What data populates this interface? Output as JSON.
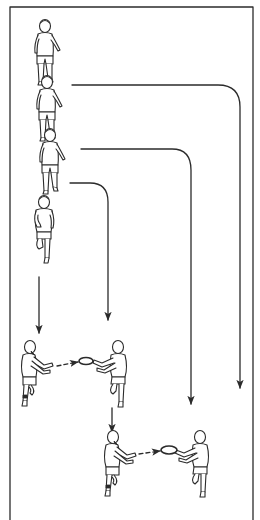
{
  "diagram": {
    "type": "sports-drill-illustration",
    "colors": {
      "line": "#2b2b2b",
      "background": "#ffffff"
    },
    "field": {
      "left": 10,
      "top": 7,
      "right": 253
    },
    "queue_players": 4,
    "runs": [
      {
        "id": "run-1",
        "start": [
          72,
          85
        ],
        "corner_x": 240,
        "end_y": 388
      },
      {
        "id": "run-2",
        "start": [
          81,
          149
        ],
        "corner_x": 191,
        "end_y": 404
      },
      {
        "id": "run-3",
        "start": [
          70,
          183
        ],
        "corner_x": 108,
        "end_y": 320
      }
    ],
    "straight_arrows": [
      {
        "id": "lead-arrow",
        "x": 39,
        "from_y": 277,
        "to_y": 333
      },
      {
        "id": "follow-arrow",
        "x": 112,
        "from_y": 408,
        "to_y": 432
      }
    ],
    "pairs": [
      {
        "id": "pair-1",
        "passer": [
          30,
          375
        ],
        "receiver": [
          118,
          375
        ],
        "object": "ring"
      },
      {
        "id": "pair-2",
        "passer": [
          113,
          465
        ],
        "receiver": [
          200,
          465
        ],
        "object": "ring"
      }
    ]
  }
}
